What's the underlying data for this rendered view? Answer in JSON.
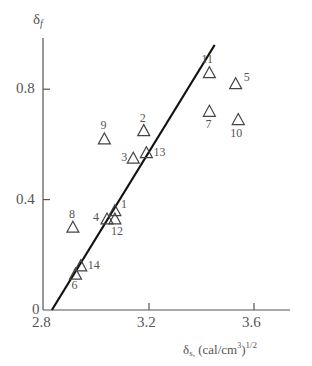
{
  "chart_data": {
    "type": "scatter",
    "title": "",
    "xlabel": "δs, (cal/cm³)^1/2",
    "ylabel": "δf",
    "xlim": [
      2.8,
      3.75
    ],
    "ylim": [
      0,
      0.98
    ],
    "grid": false,
    "legend": null,
    "x_ticks": [
      2.8,
      3.2,
      3.6
    ],
    "x_tick_labels": [
      "2.8",
      "3.2",
      "3.6"
    ],
    "y_ticks": [
      0,
      0.4,
      0.8
    ],
    "y_tick_labels": [
      "0",
      "0.4",
      "0.8"
    ],
    "marker": "open-triangle",
    "points": [
      {
        "label": "1",
        "x": 3.07,
        "y": 0.36
      },
      {
        "label": "2",
        "x": 3.18,
        "y": 0.65
      },
      {
        "label": "3",
        "x": 3.14,
        "y": 0.55
      },
      {
        "label": "4",
        "x": 3.04,
        "y": 0.33
      },
      {
        "label": "5",
        "x": 3.53,
        "y": 0.82
      },
      {
        "label": "6",
        "x": 2.92,
        "y": 0.13
      },
      {
        "label": "7",
        "x": 3.43,
        "y": 0.72
      },
      {
        "label": "8",
        "x": 2.91,
        "y": 0.3
      },
      {
        "label": "9",
        "x": 3.03,
        "y": 0.62
      },
      {
        "label": "10",
        "x": 3.54,
        "y": 0.69
      },
      {
        "label": "11",
        "x": 3.43,
        "y": 0.86
      },
      {
        "label": "12",
        "x": 3.07,
        "y": 0.33
      },
      {
        "label": "13",
        "x": 3.19,
        "y": 0.57
      },
      {
        "label": "14",
        "x": 2.94,
        "y": 0.16
      }
    ],
    "fit_line": {
      "x": [
        2.83,
        3.45
      ],
      "y": [
        0.0,
        0.96
      ]
    }
  },
  "labels": {
    "y_axis": "δ",
    "y_axis_sub": "f",
    "x_axis_delta": "δ",
    "x_axis_sub": "s,",
    "x_axis_units": "(cal/cm",
    "x_axis_units_sup1": "3",
    "x_axis_units_close": ")",
    "x_axis_units_sup2": "1/2"
  }
}
